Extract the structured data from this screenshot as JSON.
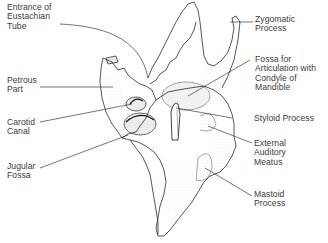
{
  "diagram": {
    "labels": {
      "eustachian": "Entrance of\nEustachian\nTube",
      "petrous": "Petrous\nPart",
      "carotid": "Carotid\nCanal",
      "jugular": "Jugular\nFossa",
      "zygomatic": "Zygomatic\nProcess",
      "fossa_mandible": "Fossa for\nArticulation with\nCondyle of\nMandible",
      "styloid": "Styloid Process",
      "external_auditory": "External\nAuditory\nMeatus",
      "mastoid": "Mastoid\nProcess"
    },
    "colors": {
      "ink": "#2a2a2a",
      "label_text": "#3a3a3a",
      "background": "#ffffff"
    }
  }
}
